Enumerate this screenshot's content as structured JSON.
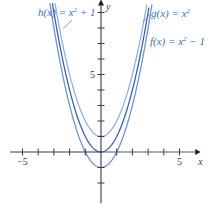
{
  "chart_data": {
    "type": "line",
    "title": "",
    "xlabel": "x",
    "ylabel": "y",
    "xlim": [
      -6,
      6.3
    ],
    "ylim": [
      -3.4,
      9.8
    ],
    "x_ticks": [
      -5,
      -4,
      -3,
      -2,
      -1,
      1,
      2,
      3,
      4,
      5
    ],
    "y_ticks": [
      -2,
      -1,
      1,
      2,
      3,
      4,
      5,
      6,
      7,
      8,
      9
    ],
    "x_tick_labels": [
      {
        "value": -5,
        "text": "−5"
      },
      {
        "value": 5,
        "text": "5"
      }
    ],
    "y_tick_labels": [
      {
        "value": 5,
        "text": "5"
      }
    ],
    "grid": false,
    "series": [
      {
        "name": "h(x) = x² + 1",
        "label_main": "h(x) = x",
        "label_sup": "2",
        "label_tail": " + 1",
        "formula": "x^2+1",
        "color": "#8fb2de"
      },
      {
        "name": "g(x) = x²",
        "label_main": "g(x) = x",
        "label_sup": "2",
        "label_tail": "",
        "formula": "x^2",
        "color": "#3b63a8"
      },
      {
        "name": "f(x) = x² − 1",
        "label_main": "f(x) = x",
        "label_sup": "2",
        "label_tail": " − 1",
        "formula": "x^2-1",
        "color": "#6f93cf"
      }
    ]
  },
  "colors": {
    "axis": "#3a3650",
    "axis_right": "#4a6a50",
    "leader": "#6a6a6a"
  }
}
